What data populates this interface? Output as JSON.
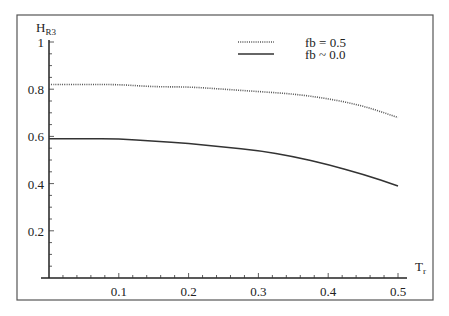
{
  "chart_data": {
    "type": "line",
    "title": "",
    "xlabel": "T",
    "xlabel_sub": "r",
    "ylabel": "H",
    "ylabel_sub": "R3",
    "xlim": [
      0,
      0.5
    ],
    "ylim": [
      0,
      1
    ],
    "x_ticks": [
      "0.1",
      "0.2",
      "0.3",
      "0.4",
      "0.5"
    ],
    "y_ticks": [
      "0.2",
      "0.4",
      "0.6",
      "0.8",
      "1"
    ],
    "grid": false,
    "legend_position": "top-right",
    "x": [
      0.0,
      0.05,
      0.1,
      0.15,
      0.2,
      0.25,
      0.3,
      0.35,
      0.4,
      0.45,
      0.5
    ],
    "series": [
      {
        "name": "fb = 0.5",
        "style": "dotted",
        "values": [
          0.82,
          0.82,
          0.82,
          0.81,
          0.81,
          0.8,
          0.79,
          0.78,
          0.76,
          0.73,
          0.68
        ]
      },
      {
        "name": "fb ~ 0.0",
        "style": "solid",
        "values": [
          0.59,
          0.59,
          0.59,
          0.58,
          0.57,
          0.555,
          0.54,
          0.515,
          0.48,
          0.44,
          0.39
        ]
      }
    ]
  },
  "legend": {
    "items": [
      {
        "label": "fb = 0.5",
        "style": "dotted"
      },
      {
        "label": "fb ~ 0.0",
        "style": "solid"
      }
    ]
  },
  "axes": {
    "x_label_main": "T",
    "x_label_sub": "r",
    "y_label_main": "H",
    "y_label_sub": "R3"
  },
  "colors": {
    "line_dotted": "#555555",
    "line_solid": "#333333",
    "axis": "#222222",
    "frame": "#555555"
  }
}
